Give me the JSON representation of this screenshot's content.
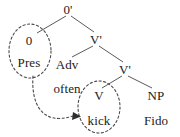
{
  "figure": {
    "kind": "syntactic-tree-diagram",
    "width": 180,
    "height": 137,
    "background_color": "#ffffff",
    "line_color": "#5a5a5a",
    "text_color": "#222222",
    "dashed_color": "#4a4a4a"
  },
  "tree": {
    "root": {
      "id": "root",
      "label": "0'",
      "x": 68,
      "y": 9
    },
    "nodes": [
      {
        "id": "infl",
        "label": "0",
        "x": 29,
        "y": 40
      },
      {
        "id": "infl-feature",
        "label": "Pres",
        "x": 29,
        "y": 62
      },
      {
        "id": "vbar-upper",
        "label": "V'",
        "x": 96,
        "y": 39
      },
      {
        "id": "adv",
        "label": "Adv",
        "x": 67,
        "y": 64
      },
      {
        "id": "adv-word",
        "label": "often",
        "x": 67,
        "y": 88
      },
      {
        "id": "vbar-lower",
        "label": "V'",
        "x": 125,
        "y": 69
      },
      {
        "id": "verb",
        "label": "V",
        "x": 99,
        "y": 95
      },
      {
        "id": "verb-word",
        "label": "kick",
        "x": 99,
        "y": 120
      },
      {
        "id": "np",
        "label": "NP",
        "x": 156,
        "y": 95
      },
      {
        "id": "np-word",
        "label": "Fido",
        "x": 156,
        "y": 120
      }
    ],
    "branches": [
      {
        "from": "root",
        "to": "infl"
      },
      {
        "from": "root",
        "to": "vbar-upper"
      },
      {
        "from": "vbar-upper",
        "to": "adv"
      },
      {
        "from": "vbar-upper",
        "to": "vbar-lower"
      },
      {
        "from": "vbar-lower",
        "to": "verb"
      },
      {
        "from": "vbar-lower",
        "to": "np"
      }
    ],
    "circles": [
      {
        "id": "circle-infl",
        "label": "dashed-oval-around-infl",
        "cx": 30,
        "cy": 51,
        "rx": 21,
        "ry": 27
      },
      {
        "id": "circle-verb",
        "label": "dashed-oval-around-verb",
        "cx": 99,
        "cy": 107,
        "rx": 21,
        "ry": 26
      }
    ],
    "movement_arrow": {
      "id": "affix-hopping-arrow",
      "label": "dashed-movement-arrow",
      "from": "circle-infl",
      "to": "circle-verb",
      "start_x": 33,
      "start_y": 76,
      "control_x": 38,
      "control_y": 123,
      "end_x": 77,
      "end_y": 116
    }
  }
}
